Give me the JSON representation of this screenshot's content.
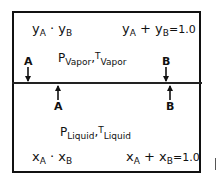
{
  "vapor": {
    "fractions": {
      "var1": "y",
      "sub1": "A",
      "dot": "·",
      "var2": "y",
      "sub2": "B"
    },
    "sum": {
      "var1": "y",
      "sub1": "A",
      "plus": "+",
      "var2": "y",
      "sub2": "B",
      "eq": "=1.0"
    },
    "conditions": {
      "p": "P",
      "p_sub": "Vapor",
      "comma": ",",
      "t": "T",
      "t_sub": "Vapor"
    }
  },
  "liquid": {
    "fractions": {
      "var1": "x",
      "sub1": "A",
      "dot": "·",
      "var2": "x",
      "sub2": "B"
    },
    "sum": {
      "var1": "x",
      "sub1": "A",
      "plus": "+",
      "var2": "x",
      "sub2": "B",
      "eq": "=1.0"
    },
    "conditions": {
      "p": "P",
      "p_sub": "Liquid",
      "comma": ",",
      "t": "T",
      "t_sub": "Liquid"
    }
  },
  "arrows": {
    "down_left": "A",
    "down_right": "B",
    "up_left": "A",
    "up_right": "B"
  }
}
